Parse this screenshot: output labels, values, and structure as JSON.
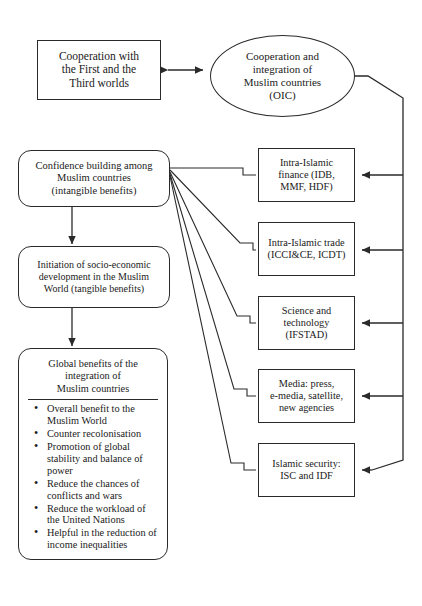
{
  "diagram": {
    "nodes": {
      "cooperation_world": {
        "lines": [
          "Cooperation with",
          "the First and the",
          "Third worlds"
        ]
      },
      "oic": {
        "lines": [
          "Cooperation and",
          "integration of",
          "Muslim countries",
          "(OIC)"
        ]
      },
      "confidence": {
        "lines": [
          "Confidence building among",
          "Muslim countries",
          "(intangible benefits)"
        ]
      },
      "initiation": {
        "lines": [
          "Initiation of socio-economic",
          "development in the Muslim",
          "World (tangible benefits)"
        ]
      },
      "global_benefits": {
        "title_lines": [
          "Global benefits of the",
          "integration of",
          "Muslim countries"
        ],
        "bullets": [
          "Overall benefit to the Muslim World",
          "Counter recolonisation",
          "Promotion of global stability and balance of power",
          "Reduce the chances of conflicts and wars",
          "Reduce the workload of the United Nations",
          "Helpful in the reduction of income inequalities"
        ]
      },
      "finance": {
        "lines": [
          "Intra-Islamic",
          "finance (IDB,",
          "MMF, HDF)"
        ]
      },
      "trade": {
        "lines": [
          "Intra-Islamic trade",
          "(ICCI&CE, ICDT)"
        ]
      },
      "science": {
        "lines": [
          "Science and",
          "technology",
          "(IFSTAD)"
        ]
      },
      "media": {
        "lines": [
          "Media: press,",
          "e-media, satellite,",
          "new agencies"
        ]
      },
      "security": {
        "lines": [
          "Islamic security:",
          "ISC and IDF"
        ]
      }
    },
    "colors": {
      "stroke": "#2a2a2a",
      "text": "#1a1a1a",
      "background": "#ffffff"
    }
  }
}
